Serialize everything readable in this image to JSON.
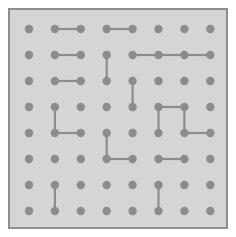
{
  "app": {
    "title": "Dot Grid Puzzle",
    "type": "dot-grid-diagram"
  },
  "board": {
    "name": "dot-grid-board",
    "x": 8,
    "y": 8,
    "width": 220,
    "height": 221,
    "background_color": "#d5d5d3",
    "border_color": "#8e8e8c",
    "border_width": 2,
    "page_background_color": "#ffffff"
  },
  "grid": {
    "columns": 8,
    "rows": 8,
    "origin_x": 19,
    "origin_y": 19,
    "spacing_x": 25.9,
    "spacing_y": 26.0,
    "dot_radius": 4.2,
    "dot_color": "#8c8c8a",
    "edge_color": "#8c8c8a",
    "edge_width": 2.2,
    "column_labels": [
      "c1",
      "c2",
      "c3",
      "c4",
      "c5",
      "c6",
      "c7",
      "c8"
    ],
    "row_labels": [
      "r1",
      "r2",
      "r3",
      "r4",
      "r5",
      "r6",
      "r7",
      "r8"
    ]
  },
  "edges": [
    {
      "name": "edge-r1-c2-c3",
      "orientation": "horizontal",
      "row": 1,
      "col": 2,
      "to_row": 1,
      "to_col": 3
    },
    {
      "name": "edge-r1-c4-c5",
      "orientation": "horizontal",
      "row": 1,
      "col": 4,
      "to_row": 1,
      "to_col": 5
    },
    {
      "name": "edge-r2-c2-c3",
      "orientation": "horizontal",
      "row": 2,
      "col": 2,
      "to_row": 2,
      "to_col": 3
    },
    {
      "name": "edge-r2-c5-c6",
      "orientation": "horizontal",
      "row": 2,
      "col": 5,
      "to_row": 2,
      "to_col": 6
    },
    {
      "name": "edge-r2-c6-c7",
      "orientation": "horizontal",
      "row": 2,
      "col": 6,
      "to_row": 2,
      "to_col": 7
    },
    {
      "name": "edge-r2-c7-c8",
      "orientation": "horizontal",
      "row": 2,
      "col": 7,
      "to_row": 2,
      "to_col": 8
    },
    {
      "name": "edge-c4-r2-r3",
      "orientation": "vertical",
      "row": 2,
      "col": 4,
      "to_row": 3,
      "to_col": 4
    },
    {
      "name": "edge-r3-c2-c3",
      "orientation": "horizontal",
      "row": 3,
      "col": 2,
      "to_row": 3,
      "to_col": 3
    },
    {
      "name": "edge-c5-r3-r4",
      "orientation": "vertical",
      "row": 3,
      "col": 5,
      "to_row": 4,
      "to_col": 5
    },
    {
      "name": "edge-c2-r4-r5",
      "orientation": "vertical",
      "row": 4,
      "col": 2,
      "to_row": 5,
      "to_col": 2
    },
    {
      "name": "edge-r4-c6-c7",
      "orientation": "horizontal",
      "row": 4,
      "col": 6,
      "to_row": 4,
      "to_col": 7
    },
    {
      "name": "edge-c6-r4-r5",
      "orientation": "vertical",
      "row": 4,
      "col": 6,
      "to_row": 5,
      "to_col": 6
    },
    {
      "name": "edge-c7-r4-r5",
      "orientation": "vertical",
      "row": 4,
      "col": 7,
      "to_row": 5,
      "to_col": 7
    },
    {
      "name": "edge-r5-c2-c3",
      "orientation": "horizontal",
      "row": 5,
      "col": 2,
      "to_row": 5,
      "to_col": 3
    },
    {
      "name": "edge-r5-c7-c8",
      "orientation": "horizontal",
      "row": 5,
      "col": 7,
      "to_row": 5,
      "to_col": 8
    },
    {
      "name": "edge-c4-r5-r6",
      "orientation": "vertical",
      "row": 5,
      "col": 4,
      "to_row": 6,
      "to_col": 4
    },
    {
      "name": "edge-r6-c4-c5",
      "orientation": "horizontal",
      "row": 6,
      "col": 4,
      "to_row": 6,
      "to_col": 5
    },
    {
      "name": "edge-r6-c6-c7",
      "orientation": "horizontal",
      "row": 6,
      "col": 6,
      "to_row": 6,
      "to_col": 7
    },
    {
      "name": "edge-c2-r7-r8",
      "orientation": "vertical",
      "row": 7,
      "col": 2,
      "to_row": 8,
      "to_col": 2
    },
    {
      "name": "edge-c6-r7-r8",
      "orientation": "vertical",
      "row": 7,
      "col": 6,
      "to_row": 8,
      "to_col": 6
    }
  ]
}
